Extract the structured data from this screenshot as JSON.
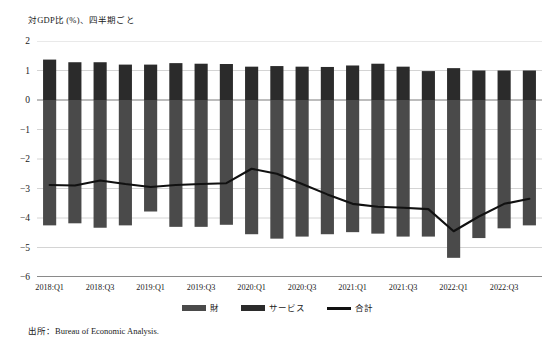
{
  "figure": {
    "axis_title": "対GDP比 (%)、四半期ごと",
    "source_note": "出所：Bureau of Economic Analysis."
  },
  "legend": {
    "items": [
      {
        "label": "財",
        "marker": "bar-swatch",
        "color": "#4a4a4a"
      },
      {
        "label": "サービス",
        "marker": "bar-swatch",
        "color": "#2b2b2b"
      },
      {
        "label": "合計",
        "marker": "line-swatch",
        "color": "#111111"
      }
    ]
  },
  "chart_data": {
    "type": "bar",
    "title": "対GDP比 (%)、四半期ごと",
    "xlabel": "",
    "ylabel": "対GDP比 (%)",
    "ylim": [
      -6,
      2
    ],
    "yticks": [
      2,
      1,
      0,
      -1,
      -2,
      -3,
      -4,
      -5,
      -6
    ],
    "ytick_labels": [
      "2",
      "1",
      "0",
      "−1",
      "−2",
      "−3",
      "−4",
      "−5",
      "−6"
    ],
    "grid": true,
    "legend_position": "bottom-center",
    "stacked": true,
    "categories": [
      "2018:Q1",
      "2018:Q2",
      "2018:Q3",
      "2018:Q4",
      "2019:Q1",
      "2019:Q2",
      "2019:Q3",
      "2019:Q4",
      "2020:Q1",
      "2020:Q2",
      "2020:Q3",
      "2020:Q4",
      "2021:Q1",
      "2021:Q2",
      "2021:Q3",
      "2021:Q4",
      "2022:Q1",
      "2022:Q2",
      "2022:Q3",
      "2022:Q4"
    ],
    "xtick_labels": [
      "2018:Q1",
      "2018:Q3",
      "2019:Q1",
      "2019:Q3",
      "2020:Q1",
      "2020:Q3",
      "2021:Q1",
      "2021:Q3",
      "2022:Q1",
      "2022:Q3"
    ],
    "xtick_indices": [
      0,
      2,
      4,
      6,
      8,
      10,
      12,
      14,
      16,
      18
    ],
    "series": [
      {
        "name": "財",
        "color": "#4a4a4a",
        "type": "bar",
        "values": [
          -4.25,
          -4.18,
          -4.33,
          -4.25,
          -3.78,
          -4.3,
          -4.3,
          -4.23,
          -4.55,
          -4.7,
          -4.63,
          -4.55,
          -4.48,
          -4.53,
          -4.63,
          -4.63,
          -5.35,
          -4.68,
          -4.35,
          -4.25
        ]
      },
      {
        "name": "サービス",
        "color": "#2b2b2b",
        "type": "bar",
        "values": [
          1.37,
          1.28,
          1.28,
          1.2,
          1.2,
          1.25,
          1.23,
          1.22,
          1.13,
          1.15,
          1.13,
          1.12,
          1.17,
          1.23,
          1.13,
          0.98,
          1.08,
          1.0,
          1.0,
          1.0
        ]
      },
      {
        "name": "合計",
        "color": "#111111",
        "type": "line",
        "values": [
          -2.88,
          -2.9,
          -2.73,
          -2.85,
          -2.95,
          -2.88,
          -2.85,
          -2.82,
          -2.33,
          -2.5,
          -2.85,
          -3.2,
          -3.52,
          -3.62,
          -3.65,
          -3.7,
          -4.45,
          -3.95,
          -3.52,
          -3.35
        ]
      }
    ]
  }
}
